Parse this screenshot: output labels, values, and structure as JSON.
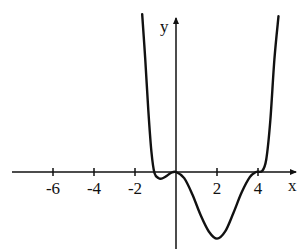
{
  "chart_data": {
    "type": "line",
    "title": "",
    "xlabel": "x",
    "ylabel": "y",
    "x_ticks": [
      -6,
      -4,
      -2,
      2,
      4
    ],
    "x_tick_labels": [
      "-6",
      "-4",
      "-2",
      "2",
      "4"
    ],
    "y_ticks": [],
    "grid": false,
    "legend": null,
    "xlim": [
      -8.1,
      6.3
    ],
    "series": [
      {
        "name": "f(x)",
        "color": "#111111",
        "description": "Polynomial-like curve: rises steeply from top left, crosses x-axis near x≈-1.1, small local minimum near x≈-0.7 (slightly below axis), touches x-axis at origin, deep minimum near x=2 (y≈-3.3), crosses back near x≈3.8, flattens/inflects at x≈4, then rises steeply to top right.",
        "points": [
          [
            -1.65,
            7.7
          ],
          [
            -1.5,
            5.5
          ],
          [
            -1.35,
            3.0
          ],
          [
            -1.2,
            1.0
          ],
          [
            -1.05,
            -0.05
          ],
          [
            -0.85,
            -0.3
          ],
          [
            -0.7,
            -0.32
          ],
          [
            -0.5,
            -0.22
          ],
          [
            -0.25,
            -0.05
          ],
          [
            0,
            0
          ],
          [
            0.4,
            -0.3
          ],
          [
            0.8,
            -1.1
          ],
          [
            1.2,
            -2.1
          ],
          [
            1.6,
            -2.9
          ],
          [
            2.0,
            -3.25
          ],
          [
            2.4,
            -2.9
          ],
          [
            2.8,
            -2.0
          ],
          [
            3.2,
            -1.0
          ],
          [
            3.6,
            -0.25
          ],
          [
            3.9,
            0.0
          ],
          [
            4.2,
            0.05
          ],
          [
            4.4,
            0.6
          ],
          [
            4.6,
            2.5
          ],
          [
            4.8,
            5.5
          ],
          [
            5.0,
            7.6
          ]
        ]
      }
    ]
  },
  "axes": {
    "x_label": "x",
    "y_label": "y",
    "tick_labels": [
      "-6",
      "-4",
      "-2",
      "2",
      "4"
    ]
  }
}
